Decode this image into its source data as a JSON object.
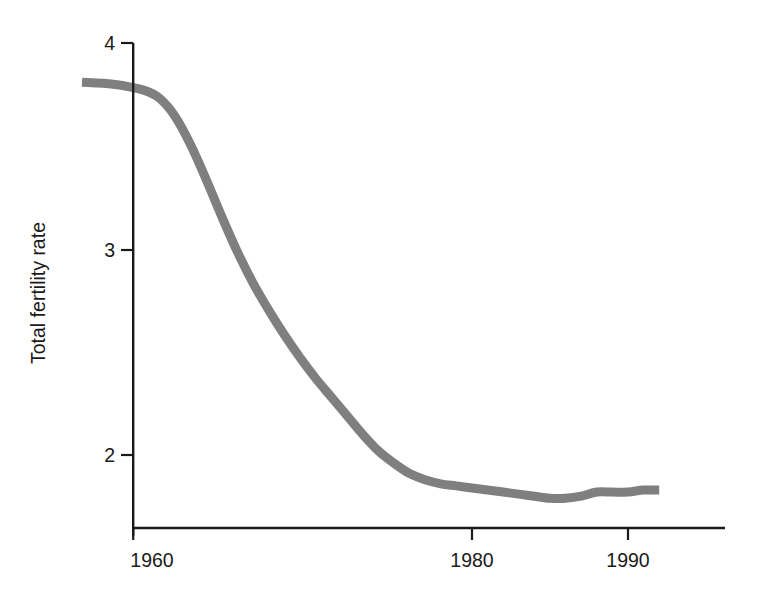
{
  "chart_data": {
    "type": "line",
    "title": "",
    "subtitle": "",
    "xlabel": "",
    "ylabel": "Total fertility rate",
    "xlim": [
      1954.8,
      1992.2
    ],
    "ylim": [
      1.65,
      4.05
    ],
    "grid": false,
    "legend": null,
    "annotations": [],
    "x_ticks": [
      1960,
      1980,
      1990
    ],
    "x_tick_labels": [
      "1960",
      "1980",
      "1990"
    ],
    "y_ticks": [
      2,
      3,
      4
    ],
    "y_tick_labels": [
      "2",
      "3",
      "4"
    ],
    "series": [
      {
        "name": "Total fertility rate",
        "color": "#7f7f7f",
        "line_width": 9,
        "x": [
          1955,
          1957,
          1959,
          1960,
          1961,
          1962,
          1963,
          1964,
          1965,
          1966,
          1967,
          1968,
          1969,
          1970,
          1971,
          1972,
          1973,
          1974,
          1975,
          1976,
          1977,
          1978,
          1979,
          1980,
          1981,
          1982,
          1983,
          1984,
          1985,
          1986,
          1987,
          1988,
          1989,
          1990,
          1991,
          1992
        ],
        "values": [
          3.81,
          3.8,
          3.77,
          3.73,
          3.64,
          3.5,
          3.33,
          3.15,
          2.98,
          2.83,
          2.7,
          2.58,
          2.47,
          2.37,
          2.28,
          2.19,
          2.1,
          2.02,
          1.96,
          1.91,
          1.88,
          1.86,
          1.85,
          1.84,
          1.83,
          1.82,
          1.81,
          1.8,
          1.79,
          1.79,
          1.8,
          1.82,
          1.82,
          1.82,
          1.83,
          1.83
        ]
      }
    ]
  },
  "axes": {
    "y_axis_label": "Total fertility rate",
    "y_tick_4": "4",
    "y_tick_3": "3",
    "y_tick_2": "2",
    "x_tick_1960": "1960",
    "x_tick_1980": "1980",
    "x_tick_1990": "1990"
  },
  "colors": {
    "series": "#7f7f7f",
    "axis": "#1a1a1a",
    "background": "#ffffff"
  }
}
